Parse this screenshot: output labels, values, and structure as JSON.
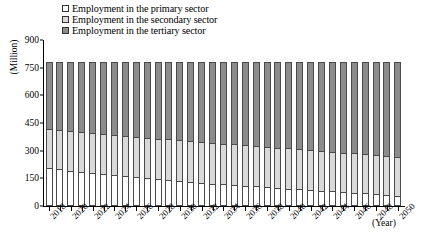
{
  "legend": {
    "position": "top-left",
    "items": [
      {
        "label": "Employment in the primary sector",
        "color": "#ffffff",
        "key": "primary"
      },
      {
        "label": "Employment in the secondary sector",
        "color": "#d9d9d9",
        "key": "secondary"
      },
      {
        "label": "Employment in the tertiary sector",
        "color": "#8c8c8c",
        "key": "tertiary"
      }
    ]
  },
  "axes": {
    "ylabel": "(Million)",
    "xlabel": "(Year)",
    "yticks": [
      0,
      150,
      300,
      450,
      600,
      750,
      900
    ],
    "ylim": [
      0,
      900
    ],
    "xtick_labels": [
      "2018",
      "2020",
      "2022",
      "2024",
      "2026",
      "2028",
      "2030",
      "2032",
      "2034",
      "2036",
      "2038",
      "2040",
      "2042",
      "2044",
      "2046",
      "2048",
      "2050"
    ],
    "grid": false
  },
  "chart_data": {
    "type": "bar",
    "stacked": true,
    "title": "",
    "xlabel": "(Year)",
    "ylabel": "(Million)",
    "ylim": [
      0,
      900
    ],
    "yticks": [
      0,
      150,
      300,
      450,
      600,
      750,
      900
    ],
    "legend_position": "top-left",
    "categories": [
      "2018",
      "2019",
      "2020",
      "2021",
      "2022",
      "2023",
      "2024",
      "2025",
      "2026",
      "2027",
      "2028",
      "2029",
      "2030",
      "2031",
      "2032",
      "2033",
      "2034",
      "2035",
      "2036",
      "2037",
      "2038",
      "2039",
      "2040",
      "2041",
      "2042",
      "2043",
      "2044",
      "2045",
      "2046",
      "2047",
      "2048",
      "2049",
      "2050"
    ],
    "series": [
      {
        "name": "Employment in the primary sector",
        "color": "#ffffff",
        "values": [
          205,
          198,
          192,
          186,
          180,
          174,
          168,
          162,
          157,
          151,
          146,
          141,
          136,
          131,
          126,
          122,
          118,
          114,
          110,
          106,
          102,
          98,
          94,
          90,
          86,
          82,
          79,
          75,
          72,
          68,
          64,
          60,
          56
        ]
      },
      {
        "name": "Employment in the secondary sector",
        "color": "#d9d9d9",
        "values": [
          210,
          212,
          213,
          214,
          215,
          216,
          217,
          218,
          218,
          219,
          219,
          220,
          220,
          220,
          220,
          220,
          220,
          220,
          220,
          220,
          220,
          219,
          219,
          218,
          218,
          217,
          216,
          215,
          214,
          213,
          212,
          211,
          210
        ]
      },
      {
        "name": "Employment in the tertiary sector",
        "color": "#8c8c8c",
        "values": [
          365,
          370,
          375,
          380,
          385,
          390,
          395,
          400,
          405,
          410,
          415,
          419,
          424,
          429,
          434,
          438,
          442,
          446,
          450,
          454,
          458,
          463,
          467,
          472,
          476,
          481,
          485,
          490,
          494,
          499,
          504,
          509,
          514
        ]
      }
    ],
    "totals": [
      780,
      780,
      780,
      780,
      780,
      780,
      780,
      780,
      780,
      780,
      780,
      780,
      780,
      780,
      780,
      780,
      780,
      780,
      780,
      780,
      780,
      780,
      780,
      780,
      780,
      780,
      780,
      780,
      780,
      780,
      780,
      780,
      780
    ]
  }
}
